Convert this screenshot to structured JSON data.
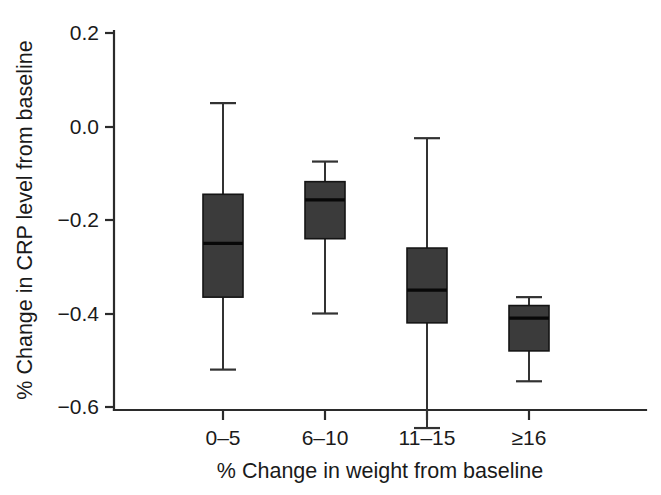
{
  "chart_data": {
    "type": "box",
    "title": "",
    "xlabel": "% Change in weight from baseline",
    "ylabel": "% Change in CRP level from baseline",
    "categories": [
      "0–5",
      "6–10",
      "11–15",
      "≥16"
    ],
    "ylim": [
      -0.68,
      0.2
    ],
    "yticks": [
      0.2,
      0.0,
      -0.2,
      -0.4,
      -0.6
    ],
    "ytick_labels": [
      "0.2",
      "0.0",
      "−0.2",
      "−0.4",
      "−0.6"
    ],
    "grid": false,
    "legend": "none",
    "box_color": "#3b3b3b",
    "line_color": "#2b2b2b",
    "boxes": [
      {
        "category": "0–5",
        "whisker_high": 0.05,
        "q3": -0.145,
        "median": -0.25,
        "q1": -0.365,
        "whisker_low": -0.52
      },
      {
        "category": "6–10",
        "whisker_high": -0.075,
        "q3": -0.118,
        "median": -0.157,
        "q1": -0.24,
        "whisker_low": -0.4
      },
      {
        "category": "11–15",
        "whisker_high": -0.025,
        "q3": -0.26,
        "median": -0.35,
        "q1": -0.42,
        "whisker_low": -0.645
      },
      {
        "category": "≥16",
        "whisker_high": -0.365,
        "q3": -0.383,
        "median": -0.41,
        "q1": -0.48,
        "whisker_low": -0.545
      }
    ]
  }
}
